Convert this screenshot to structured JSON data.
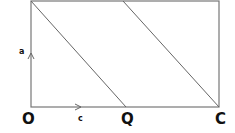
{
  "diagram": {
    "type": "geometry",
    "points": {
      "O": {
        "label": "O",
        "x": 31,
        "y": 107
      },
      "Q": {
        "label": "Q",
        "x": 126,
        "y": 107
      },
      "C": {
        "label": "C",
        "x": 219,
        "y": 107
      },
      "top_left": {
        "x": 31,
        "y": 1
      },
      "top_mid": {
        "x": 123,
        "y": 1
      },
      "top_right": {
        "x": 219,
        "y": 1
      }
    },
    "vectors": {
      "a": {
        "label": "a",
        "from": "O",
        "direction": "up"
      },
      "c": {
        "label": "c",
        "from": "O",
        "direction": "right"
      }
    },
    "colors": {
      "line": "#777777",
      "text": "#111111"
    }
  }
}
